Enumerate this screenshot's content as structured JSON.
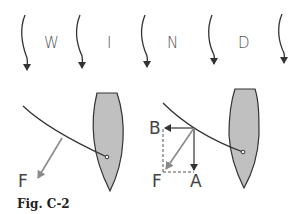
{
  "figure": {
    "caption": "Fig. C-2",
    "wind_label_letters": [
      "W",
      "I",
      "N",
      "D"
    ],
    "wind_arrow_count": 5,
    "left_panel": {
      "force_label": "F",
      "force_color": "#888888"
    },
    "right_panel": {
      "labels": {
        "b": "B",
        "f": "F",
        "a": "A"
      },
      "force_color": "#888888",
      "component_color": "#333333"
    },
    "hull_fill": "#c0c0c0"
  }
}
